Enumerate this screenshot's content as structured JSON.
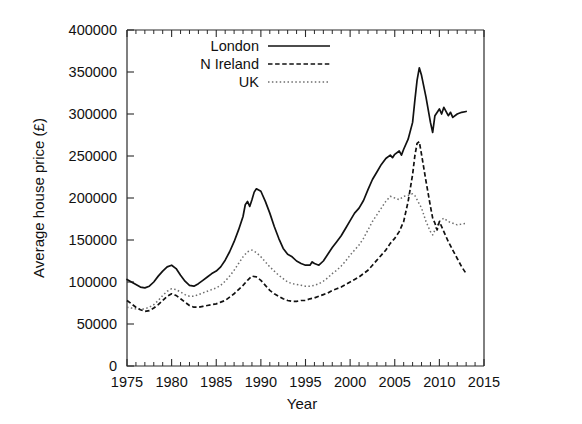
{
  "chart_data": {
    "type": "line",
    "title": "",
    "xlabel": "Year",
    "ylabel": "Average house price (£)",
    "xlim": [
      1975,
      2015
    ],
    "ylim": [
      0,
      400000
    ],
    "xticks": [
      1975,
      1980,
      1985,
      1990,
      1995,
      2000,
      2005,
      2010,
      2015
    ],
    "xtick_labels": [
      "1975",
      "1980",
      "1985",
      "1990",
      "1995",
      "2000",
      "2005",
      "2010",
      "2015"
    ],
    "yticks": [
      0,
      50000,
      100000,
      150000,
      200000,
      250000,
      300000,
      350000,
      400000
    ],
    "ytick_labels": [
      "0",
      "50000",
      "100000",
      "150000",
      "200000",
      "250000",
      "300000",
      "350000",
      "400000"
    ],
    "x_minor_interval": 1,
    "y_minor_ticks": false,
    "grid": false,
    "legend_position": "top-center",
    "legend_entries": [
      "London",
      "N Ireland",
      "UK"
    ],
    "series": [
      {
        "name": "London",
        "style": "solid",
        "color": "#111111",
        "x": [
          1975.0,
          1975.5,
          1976.0,
          1976.5,
          1977.0,
          1977.5,
          1978.0,
          1978.5,
          1979.0,
          1979.5,
          1980.0,
          1980.5,
          1981.0,
          1981.5,
          1982.0,
          1982.5,
          1983.0,
          1983.5,
          1984.0,
          1984.5,
          1985.0,
          1985.5,
          1986.0,
          1986.5,
          1987.0,
          1987.5,
          1988.0,
          1988.25,
          1988.5,
          1988.75,
          1989.0,
          1989.25,
          1989.5,
          1990.0,
          1990.5,
          1991.0,
          1991.5,
          1992.0,
          1992.5,
          1993.0,
          1993.5,
          1994.0,
          1994.5,
          1995.0,
          1995.5,
          1995.75,
          1996.0,
          1996.5,
          1997.0,
          1997.5,
          1998.0,
          1998.5,
          1999.0,
          1999.5,
          2000.0,
          2000.5,
          2001.0,
          2001.5,
          2002.0,
          2002.5,
          2003.0,
          2003.5,
          2004.0,
          2004.5,
          2004.75,
          2005.0,
          2005.5,
          2005.75,
          2006.0,
          2006.5,
          2007.0,
          2007.25,
          2007.5,
          2007.75,
          2008.0,
          2008.5,
          2009.0,
          2009.25,
          2009.5,
          2010.0,
          2010.25,
          2010.5,
          2011.0,
          2011.25,
          2011.5,
          2012.0,
          2012.5,
          2013.0
        ],
        "y": [
          103000,
          100000,
          97000,
          94000,
          93000,
          95000,
          100000,
          107000,
          113000,
          118000,
          120000,
          116000,
          108000,
          101000,
          96000,
          95000,
          98000,
          102000,
          106000,
          110000,
          113000,
          118000,
          126000,
          136000,
          148000,
          162000,
          178000,
          192000,
          196000,
          190000,
          198000,
          207000,
          211000,
          208000,
          196000,
          182000,
          166000,
          152000,
          140000,
          133000,
          130000,
          125000,
          122000,
          120000,
          120000,
          124000,
          122000,
          120000,
          125000,
          133000,
          141000,
          148000,
          155000,
          164000,
          173000,
          182000,
          188000,
          197000,
          210000,
          222000,
          231000,
          240000,
          247000,
          251000,
          248000,
          252000,
          256000,
          251000,
          258000,
          270000,
          290000,
          316000,
          340000,
          355000,
          346000,
          320000,
          290000,
          278000,
          298000,
          306000,
          300000,
          308000,
          298000,
          302000,
          296000,
          300000,
          302000,
          303000
        ]
      },
      {
        "name": "N Ireland",
        "style": "dashed",
        "color": "#111111",
        "x": [
          1975.0,
          1975.5,
          1976.0,
          1976.5,
          1977.0,
          1977.5,
          1978.0,
          1978.5,
          1979.0,
          1979.5,
          1980.0,
          1980.5,
          1981.0,
          1981.5,
          1982.0,
          1982.5,
          1983.0,
          1983.5,
          1984.0,
          1984.5,
          1985.0,
          1985.5,
          1986.0,
          1986.5,
          1987.0,
          1987.5,
          1988.0,
          1988.5,
          1989.0,
          1989.5,
          1990.0,
          1990.5,
          1991.0,
          1991.5,
          1992.0,
          1992.5,
          1993.0,
          1993.5,
          1994.0,
          1994.5,
          1995.0,
          1995.5,
          1996.0,
          1996.5,
          1997.0,
          1997.5,
          1998.0,
          1998.5,
          1999.0,
          1999.5,
          2000.0,
          2000.5,
          2001.0,
          2001.5,
          2002.0,
          2002.5,
          2003.0,
          2003.5,
          2004.0,
          2004.5,
          2005.0,
          2005.5,
          2006.0,
          2006.5,
          2007.0,
          2007.25,
          2007.5,
          2007.75,
          2008.0,
          2008.5,
          2009.0,
          2009.25,
          2009.5,
          2009.75,
          2010.0,
          2010.5,
          2011.0,
          2011.5,
          2012.0,
          2012.5,
          2013.0
        ],
        "y": [
          78000,
          74000,
          70000,
          67000,
          65000,
          66000,
          69000,
          73000,
          78000,
          83000,
          86000,
          84000,
          80000,
          76000,
          72000,
          70000,
          70000,
          71000,
          72000,
          73000,
          74000,
          76000,
          78000,
          82000,
          86000,
          91000,
          96000,
          102000,
          107000,
          106000,
          102000,
          96000,
          90000,
          86000,
          83000,
          80000,
          78000,
          77000,
          77000,
          78000,
          78000,
          80000,
          81000,
          83000,
          85000,
          87000,
          90000,
          92000,
          94000,
          97000,
          100000,
          103000,
          106000,
          110000,
          114000,
          120000,
          126000,
          132000,
          138000,
          146000,
          152000,
          160000,
          172000,
          196000,
          228000,
          250000,
          265000,
          267000,
          252000,
          220000,
          190000,
          176000,
          170000,
          162000,
          172000,
          160000,
          148000,
          138000,
          128000,
          118000,
          110000
        ]
      },
      {
        "name": "UK",
        "style": "dotted",
        "color": "#6e6e6e",
        "x": [
          1975.0,
          1975.5,
          1976.0,
          1976.5,
          1977.0,
          1977.5,
          1978.0,
          1978.5,
          1979.0,
          1979.5,
          1980.0,
          1980.5,
          1981.0,
          1981.5,
          1982.0,
          1982.5,
          1983.0,
          1983.5,
          1984.0,
          1984.5,
          1985.0,
          1985.5,
          1986.0,
          1986.5,
          1987.0,
          1987.5,
          1988.0,
          1988.5,
          1989.0,
          1989.5,
          1990.0,
          1990.5,
          1991.0,
          1991.5,
          1992.0,
          1992.5,
          1993.0,
          1993.5,
          1994.0,
          1994.5,
          1995.0,
          1995.5,
          1996.0,
          1996.5,
          1997.0,
          1997.5,
          1998.0,
          1998.5,
          1999.0,
          1999.5,
          2000.0,
          2000.5,
          2001.0,
          2001.5,
          2002.0,
          2002.5,
          2003.0,
          2003.5,
          2004.0,
          2004.5,
          2005.0,
          2005.5,
          2006.0,
          2006.5,
          2007.0,
          2007.25,
          2007.5,
          2008.0,
          2008.5,
          2009.0,
          2009.25,
          2009.5,
          2010.0,
          2010.5,
          2011.0,
          2011.5,
          2012.0,
          2012.5,
          2013.0
        ],
        "y": [
          70000,
          69000,
          68000,
          68000,
          68000,
          70000,
          73000,
          78000,
          84000,
          89000,
          92000,
          91000,
          88000,
          85000,
          83000,
          83000,
          85000,
          87000,
          89000,
          91000,
          93000,
          96000,
          101000,
          107000,
          114000,
          122000,
          130000,
          136000,
          138000,
          135000,
          130000,
          124000,
          118000,
          113000,
          108000,
          104000,
          100000,
          98000,
          97000,
          96000,
          95000,
          95000,
          96000,
          98000,
          101000,
          105000,
          110000,
          114000,
          119000,
          125000,
          132000,
          138000,
          144000,
          152000,
          162000,
          172000,
          180000,
          188000,
          196000,
          202000,
          200000,
          198000,
          202000,
          203000,
          205000,
          203000,
          198000,
          188000,
          172000,
          160000,
          156000,
          162000,
          172000,
          176000,
          172000,
          170000,
          168000,
          169000,
          170000
        ]
      }
    ]
  },
  "legend": {
    "items": [
      {
        "label": "London",
        "icon": "solid-line-icon"
      },
      {
        "label": "N Ireland",
        "icon": "dashed-line-icon"
      },
      {
        "label": "UK",
        "icon": "dotted-line-icon"
      }
    ]
  },
  "colors": {
    "london": "#111111",
    "nireland": "#111111",
    "uk": "#6e6e6e",
    "axis": "#2b2b2b",
    "background": "#ffffff"
  }
}
